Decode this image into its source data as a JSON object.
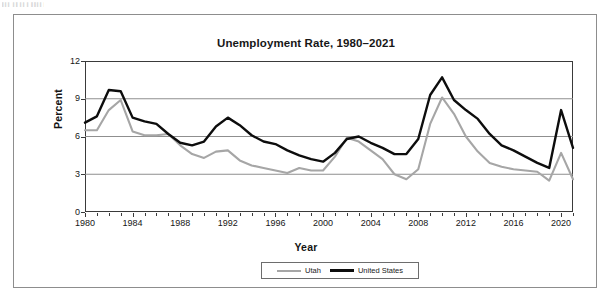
{
  "page": {
    "scan_artifact_text": "▌▍▍ ▍▌ ▍▍▍ ▌▌▍▍▍"
  },
  "chart_data": {
    "type": "line",
    "title": "Unemployment Rate, 1980–2021",
    "xlabel": "Year",
    "ylabel": "Percent",
    "ylim": [
      0,
      12
    ],
    "xlim": [
      1980,
      2021
    ],
    "yticks": [
      0,
      3,
      6,
      9,
      12
    ],
    "xticks": [
      1980,
      1984,
      1988,
      1992,
      1996,
      2000,
      2004,
      2008,
      2012,
      2016,
      2020
    ],
    "grid": true,
    "legend_position": "bottom",
    "x": [
      1980,
      1981,
      1982,
      1983,
      1984,
      1985,
      1986,
      1987,
      1988,
      1989,
      1990,
      1991,
      1992,
      1993,
      1994,
      1995,
      1996,
      1997,
      1998,
      1999,
      2000,
      2001,
      2002,
      2003,
      2004,
      2005,
      2006,
      2007,
      2008,
      2009,
      2010,
      2011,
      2012,
      2013,
      2014,
      2015,
      2016,
      2017,
      2018,
      2019,
      2020,
      2021
    ],
    "series": [
      {
        "name": "Utah",
        "color": "#a6a6a6",
        "values": [
          6.5,
          6.5,
          8.1,
          8.9,
          6.4,
          6.1,
          6.1,
          6.2,
          5.3,
          4.6,
          4.3,
          4.8,
          4.9,
          4.1,
          3.7,
          3.5,
          3.3,
          3.1,
          3.5,
          3.3,
          3.3,
          4.4,
          5.9,
          5.6,
          4.9,
          4.2,
          3.0,
          2.6,
          3.4,
          7.0,
          9.1,
          7.8,
          6.0,
          4.8,
          3.9,
          3.6,
          3.4,
          3.3,
          3.2,
          2.5,
          4.7,
          2.6
        ]
      },
      {
        "name": "United States",
        "color": "#0d0d0d",
        "values": [
          7.1,
          7.6,
          9.7,
          9.6,
          7.5,
          7.2,
          7.0,
          6.2,
          5.5,
          5.3,
          5.6,
          6.8,
          7.5,
          6.9,
          6.1,
          5.6,
          5.4,
          4.9,
          4.5,
          4.2,
          4.0,
          4.7,
          5.8,
          6.0,
          5.5,
          5.1,
          4.6,
          4.6,
          5.8,
          9.3,
          10.7,
          8.9,
          8.1,
          7.4,
          6.2,
          5.3,
          4.9,
          4.4,
          3.9,
          3.5,
          8.1,
          5.1
        ]
      }
    ]
  },
  "legend": {
    "items": [
      {
        "label": "Utah"
      },
      {
        "label": "United States"
      }
    ]
  }
}
